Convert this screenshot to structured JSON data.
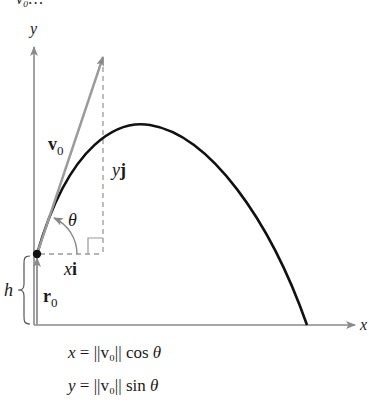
{
  "figure": {
    "top_fragment": "v₀…",
    "axes": {
      "x_label": "x",
      "y_label": "y"
    },
    "vectors": {
      "initial_velocity": {
        "label_main": "v",
        "label_sub": "0"
      },
      "initial_position": {
        "label_main": "r",
        "label_sub": "0"
      },
      "horizontal_component": {
        "label_var": "x",
        "label_unit": "i"
      },
      "vertical_component": {
        "label_var": "y",
        "label_unit": "j"
      }
    },
    "angle_label": "θ",
    "height_label": "h",
    "equations": [
      {
        "lhs": "x",
        "eq": " = ",
        "norm": "||v₀||",
        "func": " cos ",
        "arg": "θ"
      },
      {
        "lhs": "y",
        "eq": " = ",
        "norm": "||v₀||",
        "func": " sin ",
        "arg": "θ"
      }
    ],
    "colors": {
      "trajectory": "#111111",
      "axes": "#8a8a8a",
      "vector": "#9a9a9a",
      "dashed": "#9a9a9a"
    }
  }
}
